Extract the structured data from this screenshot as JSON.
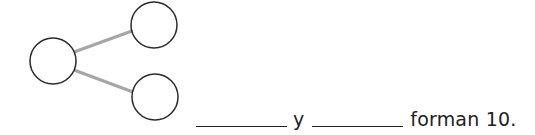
{
  "number_bond": {
    "whole": {
      "value": "",
      "cx": 53,
      "cy": 61,
      "r": 23
    },
    "parts": [
      {
        "value": "",
        "cx": 154,
        "cy": 25,
        "r": 23
      },
      {
        "value": "",
        "cx": 155,
        "cy": 97,
        "r": 23
      }
    ],
    "line_color": "#a6a6a6",
    "circle_stroke": "#2a2a2a"
  },
  "sentence": {
    "blank_1": "",
    "connector": "y",
    "blank_2": "",
    "ending": "forman 10."
  }
}
